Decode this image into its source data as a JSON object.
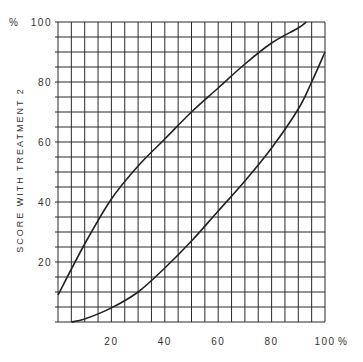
{
  "chart_data": {
    "type": "line",
    "title": "",
    "xlabel": "",
    "ylabel": "SCORE WITH TREATMENT 2",
    "x_unit": "%",
    "y_unit": "%",
    "xlim": [
      0,
      100
    ],
    "ylim": [
      0,
      100
    ],
    "grid": true,
    "grid_step": 5,
    "x_ticks": [
      20,
      40,
      60,
      80,
      100
    ],
    "y_ticks": [
      20,
      40,
      60,
      80,
      100
    ],
    "x_tick_labels": [
      "20",
      "40",
      "60",
      "80",
      "100"
    ],
    "y_tick_labels": [
      "20",
      "40",
      "60",
      "80",
      "100"
    ],
    "legend": null,
    "series": [
      {
        "name": "upper curve",
        "x": [
          0,
          10,
          20,
          30,
          40,
          50,
          60,
          70,
          80,
          90,
          93
        ],
        "y": [
          9,
          26,
          41,
          52,
          61,
          70,
          78,
          86,
          93,
          98,
          100
        ]
      },
      {
        "name": "lower curve",
        "x": [
          5,
          10,
          20,
          30,
          40,
          50,
          60,
          70,
          80,
          90,
          95,
          100
        ],
        "y": [
          0,
          1,
          4.7,
          10,
          18,
          27,
          37,
          47,
          58,
          71,
          80,
          90
        ]
      }
    ]
  },
  "labels": {
    "y_unit": "%",
    "x_unit": "%",
    "y_axis_title": "SCORE WITH TREATMENT 2"
  },
  "colors": {
    "grid": "#2b2b2b",
    "curve": "#222222",
    "background": "#ffffff"
  }
}
